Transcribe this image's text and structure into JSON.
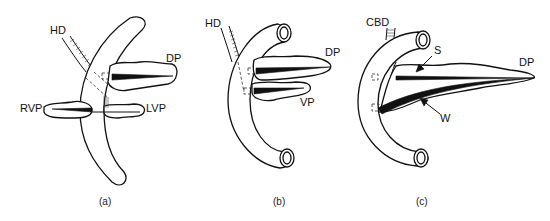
{
  "figure": {
    "panels": [
      {
        "id": "a",
        "caption": "(a)",
        "labels": {
          "hd": "HD",
          "dp": "DP",
          "rvp": "RVP",
          "lvp": "LVP"
        }
      },
      {
        "id": "b",
        "caption": "(b)",
        "labels": {
          "hd": "HD",
          "dp": "DP",
          "vp": "VP"
        }
      },
      {
        "id": "c",
        "caption": "(c)",
        "labels": {
          "cbd": "CBD",
          "s": "S",
          "dp": "DP",
          "w": "W"
        }
      }
    ]
  }
}
